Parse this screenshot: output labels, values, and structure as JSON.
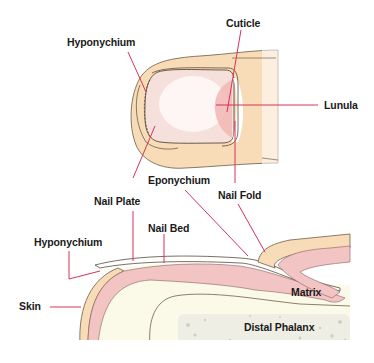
{
  "diagram": {
    "type": "anatomical-illustration",
    "views": [
      "top view of fingertip",
      "sagittal cross-section of nail"
    ],
    "labels": {
      "top_hyponychium": "Hyponychium",
      "cuticle": "Cuticle",
      "lunula": "Lunula",
      "eponychium": "Eponychium",
      "nail_fold": "Nail Fold",
      "nail_plate": "Nail Plate",
      "nail_bed": "Nail Bed",
      "bottom_hyponychium": "Hyponychium",
      "skin": "Skin",
      "matrix": "Matrix",
      "distal_phalanx": "Distal Phalanx"
    },
    "colors": {
      "leader_line": "#d8325a",
      "skin_fill": "#f8dcb8",
      "nail_fill": "#f6e0dc",
      "nail_highlight": "#fdf6f4",
      "lunula_pink": "#f2b6b4",
      "dermis_pink": "#f2c4c4",
      "tissue_fill": "#fbf9e8",
      "bone_fill": "#eeeee4",
      "outline": "#5a4a3a"
    }
  }
}
